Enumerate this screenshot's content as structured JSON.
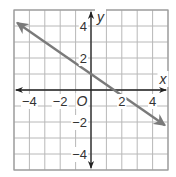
{
  "chart_data": {
    "type": "line",
    "title": "",
    "xlabel": "x",
    "ylabel": "y",
    "origin_label": "O",
    "xlim": [
      -5,
      5
    ],
    "ylim": [
      -5,
      5
    ],
    "grid": true,
    "grid_step": 1,
    "x_ticks": [
      {
        "value": -4,
        "label": "−4"
      },
      {
        "value": -2,
        "label": "−2"
      },
      {
        "value": 2,
        "label": "2"
      },
      {
        "value": 4,
        "label": "4"
      }
    ],
    "y_ticks": [
      {
        "value": 4,
        "label": "4"
      },
      {
        "value": 2,
        "label": "2"
      },
      {
        "value": -2,
        "label": "−2"
      },
      {
        "value": -4,
        "label": "−4"
      }
    ],
    "series": [
      {
        "name": "line",
        "equation": "y = -2/3 x + 1",
        "slope": -0.6667,
        "y_intercept": 1,
        "x_intercept": 1.5,
        "x": [
          -4.8,
          4.8
        ],
        "y": [
          4.2,
          -2.2
        ],
        "arrows": "both",
        "color": "#7a7a7a"
      }
    ],
    "colors": {
      "grid": "#b8b8b8",
      "axes": "#222222",
      "line": "#7a7a7a",
      "border": "#9a9a9a"
    }
  }
}
